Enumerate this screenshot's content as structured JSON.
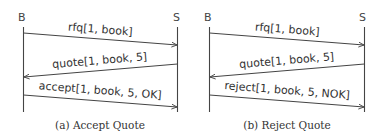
{
  "diagrams": [
    {
      "caption": "(a) Accept Quote",
      "parties": {
        "left": "B",
        "right": "S"
      },
      "messages": [
        {
          "label": "rfq[1, book]",
          "direction": "B->S"
        },
        {
          "label": "quote[1, book, 5]",
          "direction": "S->B"
        },
        {
          "label": "accept[1, book, 5, OK]",
          "direction": "B->S"
        }
      ]
    },
    {
      "caption": "(b) Reject Quote",
      "parties": {
        "left": "B",
        "right": "S"
      },
      "messages": [
        {
          "label": "rfq[1, book]",
          "direction": "B->S"
        },
        {
          "label": "quote[1, book, 5]",
          "direction": "S->B"
        },
        {
          "label": "reject[1, book, 5, NOK]",
          "direction": "B->S"
        }
      ]
    }
  ],
  "colors": {
    "line": "#444444",
    "text": "#333333"
  }
}
